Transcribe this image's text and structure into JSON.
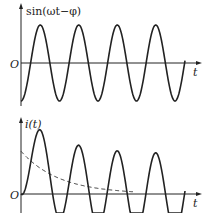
{
  "chart_data": [
    {
      "type": "line",
      "title": "",
      "ylabel": "sin(ωt−φ)",
      "xlabel": "t",
      "origin_label": "O",
      "series": [
        {
          "name": "sin(ωt−φ)",
          "style": "solid",
          "description": "steady sinusoid, constant amplitude, ~4.3 periods, starting at minimum"
        }
      ],
      "grid": false
    },
    {
      "type": "line",
      "title": "",
      "ylabel": "i(t)",
      "xlabel": "t",
      "origin_label": "O",
      "series": [
        {
          "name": "i(t)",
          "style": "solid",
          "description": "starts at 0, first peak highest, settles to steady oscillation with smaller amplitude (transient)"
        },
        {
          "name": "decaying DC component",
          "style": "dashed",
          "description": "exponentially decaying curve from positive value to ~0"
        }
      ],
      "grid": false
    }
  ],
  "top": {
    "ylabel": "sin(ωt−φ)",
    "xlabel": "t",
    "origin": "O"
  },
  "bottom": {
    "ylabel": "i(t)",
    "xlabel": "t",
    "origin": "O"
  }
}
